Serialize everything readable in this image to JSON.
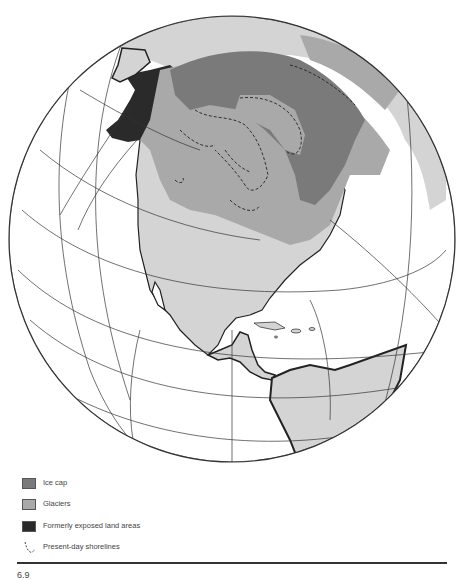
{
  "figure": {
    "caption": "6.9",
    "type": "orthographic globe map",
    "region": "North America during last glaciation"
  },
  "colors": {
    "ice_cap": "#7a7a7a",
    "glaciers": "#a9a9a9",
    "formerly_exposed_land": "#2a2a2a",
    "land": "#d4d4d4",
    "ocean": "#ffffff",
    "graticule": "#333333",
    "shoreline": "#222222"
  },
  "legend": {
    "items": [
      {
        "key": "ice_cap",
        "label": "Ice cap"
      },
      {
        "key": "glaciers",
        "label": "Glaciers"
      },
      {
        "key": "formerly_exposed",
        "label": "Formerly exposed land areas"
      },
      {
        "key": "shorelines",
        "label": "Present-day shorelines"
      }
    ]
  }
}
